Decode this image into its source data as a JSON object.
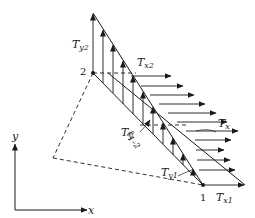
{
  "diagram": {
    "nodes": [
      {
        "id": "1",
        "label": "1",
        "x": 203,
        "y": 185
      },
      {
        "id": "2",
        "label": "2",
        "x": 93,
        "y": 73
      }
    ],
    "hidden_vertex": {
      "x": 53,
      "y": 158
    },
    "labels": {
      "Ty2": {
        "base": "T",
        "sub": "y2"
      },
      "Tx2": {
        "base": "T",
        "sub": "x2"
      },
      "Tx": {
        "base": "T",
        "sub": "x"
      },
      "Ty": {
        "base": "T",
        "sub": "y"
      },
      "Ty1": {
        "base": "T",
        "sub": "y1"
      },
      "Tx1": {
        "base": "T",
        "sub": "x1"
      },
      "edge_length": {
        "base": "ℓ",
        "sub": "1–2"
      }
    },
    "axes": {
      "x_label": "x",
      "y_label": "y"
    },
    "traction_y": {
      "count": 6,
      "max_at_node": "2",
      "min_at_node": "1"
    },
    "traction_x": {
      "count": 9,
      "max_at_node": "1",
      "min_at_node": "2"
    },
    "line_color": "#1a1a1a"
  }
}
